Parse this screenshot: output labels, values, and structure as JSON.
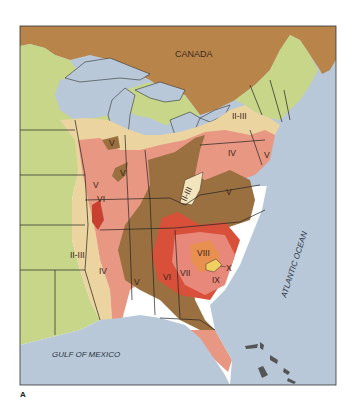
{
  "figure": {
    "panel_label": "A"
  },
  "map": {
    "region_labels": {
      "canada": "CANADA",
      "gulf": "GULF OF MEXICO",
      "ocean": "ATLANTIC OCEAN"
    },
    "zone_labels": {
      "ne_II_III": "II-III",
      "lake_V": "V",
      "il_V": "V",
      "pa_IV": "IV",
      "nj_V": "V",
      "wv_II_III": "II-III",
      "va_V": "V",
      "mo_V": "V",
      "mo_VI": "VI",
      "ar_II_III": "II-III",
      "ms_IV": "IV",
      "al_V": "V",
      "ga_VI": "VI",
      "sc_VII": "VII",
      "sc_VIII": "VIII",
      "sc_X": "X",
      "sc_IX": "IX"
    },
    "colors": {
      "canada": "#b8844a",
      "zone_I": "#c8d68a",
      "zone_II_III": "#ecd4a0",
      "zone_IV": "#e89882",
      "zone_V": "#9a7040",
      "zone_VI": "#d8503a",
      "zone_VII": "#e8887a",
      "zone_VIII": "#e89050",
      "zone_IX_X": "#f0d060",
      "water": "#b8c8d8"
    }
  }
}
